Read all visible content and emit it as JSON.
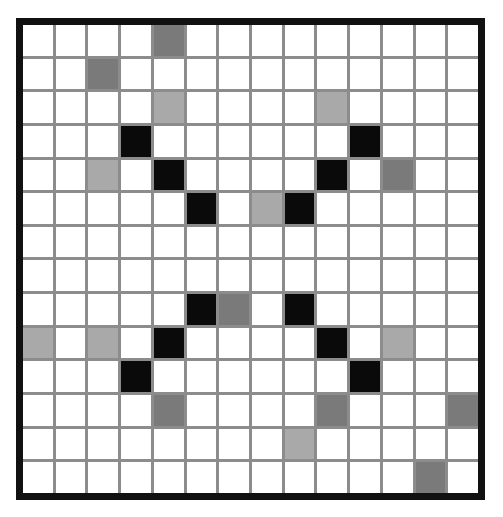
{
  "board": {
    "rows": 14,
    "cols": 14,
    "colors": {
      "empty": "#ffffff",
      "black": "#0a0a0a",
      "dark": "#7a7a7a",
      "light": "#a9a9a9",
      "grid_line": "#8c8c8c",
      "border": "#111111"
    },
    "filled_cells": [
      {
        "row": 0,
        "col": 4,
        "state": "dark"
      },
      {
        "row": 1,
        "col": 2,
        "state": "dark"
      },
      {
        "row": 2,
        "col": 4,
        "state": "light"
      },
      {
        "row": 2,
        "col": 9,
        "state": "light"
      },
      {
        "row": 3,
        "col": 3,
        "state": "black"
      },
      {
        "row": 3,
        "col": 10,
        "state": "black"
      },
      {
        "row": 4,
        "col": 2,
        "state": "light"
      },
      {
        "row": 4,
        "col": 4,
        "state": "black"
      },
      {
        "row": 4,
        "col": 9,
        "state": "black"
      },
      {
        "row": 4,
        "col": 11,
        "state": "dark"
      },
      {
        "row": 5,
        "col": 5,
        "state": "black"
      },
      {
        "row": 5,
        "col": 7,
        "state": "light"
      },
      {
        "row": 5,
        "col": 8,
        "state": "black"
      },
      {
        "row": 8,
        "col": 5,
        "state": "black"
      },
      {
        "row": 8,
        "col": 6,
        "state": "dark"
      },
      {
        "row": 8,
        "col": 8,
        "state": "black"
      },
      {
        "row": 9,
        "col": 0,
        "state": "light"
      },
      {
        "row": 9,
        "col": 2,
        "state": "light"
      },
      {
        "row": 9,
        "col": 4,
        "state": "black"
      },
      {
        "row": 9,
        "col": 9,
        "state": "black"
      },
      {
        "row": 9,
        "col": 11,
        "state": "light"
      },
      {
        "row": 10,
        "col": 3,
        "state": "black"
      },
      {
        "row": 10,
        "col": 10,
        "state": "black"
      },
      {
        "row": 11,
        "col": 4,
        "state": "dark"
      },
      {
        "row": 11,
        "col": 9,
        "state": "dark"
      },
      {
        "row": 11,
        "col": 13,
        "state": "dark"
      },
      {
        "row": 12,
        "col": 8,
        "state": "light"
      },
      {
        "row": 13,
        "col": 12,
        "state": "dark"
      }
    ]
  }
}
